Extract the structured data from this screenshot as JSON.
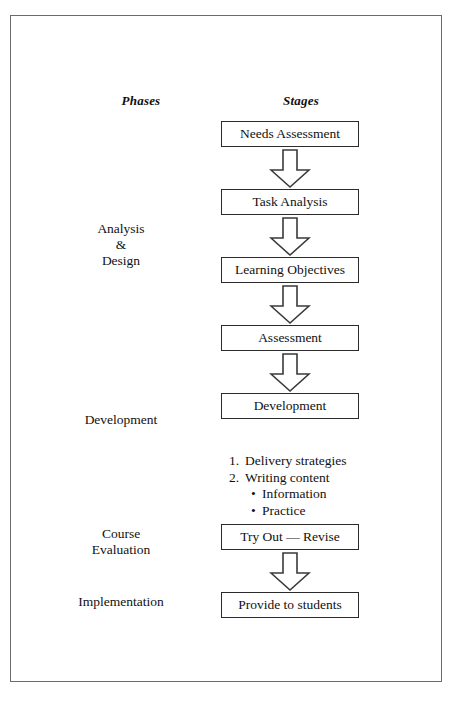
{
  "diagram": {
    "headers": {
      "phases": "Phases",
      "stages": "Stages"
    },
    "phases": [
      {
        "id": "analysis-design",
        "label": "Analysis\n&\nDesign"
      },
      {
        "id": "development",
        "label": "Development"
      },
      {
        "id": "course-evaluation",
        "label": "Course\nEvaluation"
      },
      {
        "id": "implementation",
        "label": "Implementation"
      }
    ],
    "stages": [
      {
        "id": "needs-assessment",
        "label": "Needs Assessment"
      },
      {
        "id": "task-analysis",
        "label": "Task Analysis"
      },
      {
        "id": "learning-objectives",
        "label": "Learning Objectives"
      },
      {
        "id": "assessment",
        "label": "Assessment"
      },
      {
        "id": "development",
        "label": "Development"
      },
      {
        "id": "try-out-revise",
        "label": "Try Out — Revise"
      },
      {
        "id": "provide-to-students",
        "label": "Provide to students"
      }
    ],
    "sub_list": [
      {
        "marker": "1.",
        "text": "Delivery strategies",
        "level": "numbered"
      },
      {
        "marker": "2.",
        "text": "Writing content",
        "level": "numbered"
      },
      {
        "marker": "•",
        "text": "Information",
        "level": "bullet"
      },
      {
        "marker": "•",
        "text": "Practice",
        "level": "bullet"
      }
    ],
    "colors": {
      "frame_border": "#6b6b6b",
      "box_border": "#2b2b2b",
      "arrow_stroke": "#3a3a3a",
      "background": "#ffffff",
      "text": "#111111"
    }
  }
}
